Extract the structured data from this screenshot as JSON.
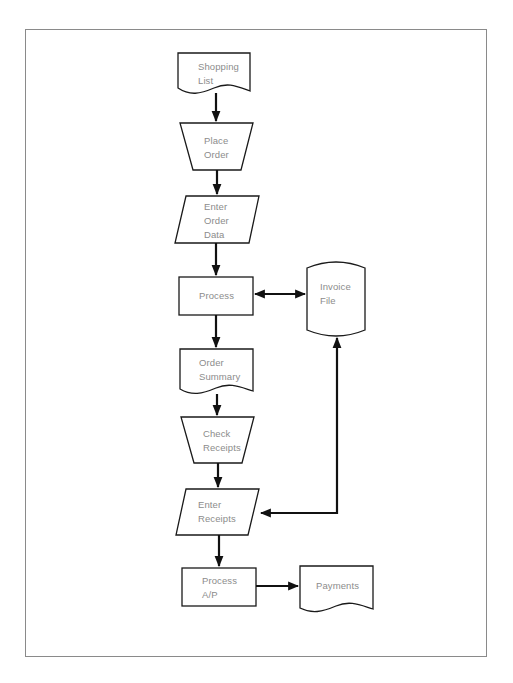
{
  "diagram": {
    "type": "flowchart",
    "nodes": [
      {
        "id": "shopping_list",
        "shape": "document",
        "label": "Shopping\nList"
      },
      {
        "id": "place_order",
        "shape": "manual-operation",
        "label": "Place\nOrder"
      },
      {
        "id": "enter_order_data",
        "shape": "data-io",
        "label": "Enter\nOrder\nData"
      },
      {
        "id": "process",
        "shape": "process",
        "label": "Process"
      },
      {
        "id": "invoice_file",
        "shape": "stored-data",
        "label": "Invoice\nFile"
      },
      {
        "id": "order_summary",
        "shape": "document",
        "label": "Order\nSummary"
      },
      {
        "id": "check_receipts",
        "shape": "manual-operation",
        "label": "Check\nReceipts"
      },
      {
        "id": "enter_receipts",
        "shape": "data-io",
        "label": "Enter\nReceipts"
      },
      {
        "id": "process_ap",
        "shape": "process",
        "label": "Process\nA/P"
      },
      {
        "id": "payments",
        "shape": "document",
        "label": "Payments"
      }
    ],
    "edges": [
      {
        "from": "shopping_list",
        "to": "place_order",
        "direction": "forward"
      },
      {
        "from": "place_order",
        "to": "enter_order_data",
        "direction": "forward"
      },
      {
        "from": "enter_order_data",
        "to": "process",
        "direction": "forward"
      },
      {
        "from": "process",
        "to": "invoice_file",
        "direction": "both"
      },
      {
        "from": "process",
        "to": "order_summary",
        "direction": "forward"
      },
      {
        "from": "order_summary",
        "to": "check_receipts",
        "direction": "forward"
      },
      {
        "from": "check_receipts",
        "to": "enter_receipts",
        "direction": "forward"
      },
      {
        "from": "enter_receipts",
        "to": "invoice_file",
        "direction": "both"
      },
      {
        "from": "enter_receipts",
        "to": "process_ap",
        "direction": "forward"
      },
      {
        "from": "process_ap",
        "to": "payments",
        "direction": "forward"
      }
    ]
  },
  "labels": {
    "shopping_list": "Shopping\nList",
    "place_order": "Place\nOrder",
    "enter_order_data": "Enter\nOrder\nData",
    "process": "Process",
    "invoice_file": "Invoice\nFile",
    "order_summary": "Order\nSummary",
    "check_receipts": "Check\nReceipts",
    "enter_receipts": "Enter\nReceipts",
    "process_ap": "Process\nA/P",
    "payments": "Payments"
  },
  "colors": {
    "stroke": "#1a1a1a",
    "text": "#8c8c8c",
    "frame": "#8a8a8a",
    "background": "#ffffff"
  }
}
